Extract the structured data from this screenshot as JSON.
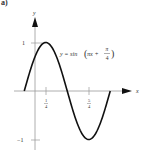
{
  "figure": {
    "panel_label": "a)",
    "equation": {
      "prefix": "y = sin",
      "inner": "πx + ",
      "frac_num": "π",
      "frac_den": "4"
    },
    "axes": {
      "x_label": "x",
      "y_label": "y",
      "y_tick_top": "1",
      "y_tick_bottom": "−1",
      "x_tick_1": {
        "num": "1",
        "den": "4"
      },
      "x_tick_2": {
        "num": "5",
        "den": "4"
      }
    }
  },
  "chart_data": {
    "type": "line",
    "xlabel": "x",
    "ylabel": "y",
    "function": "sin(pi*x + pi/4)",
    "x_range": [
      -0.25,
      1.75
    ],
    "ylim": [
      -1,
      1
    ],
    "x_ticks": [
      "1/4",
      "5/4"
    ],
    "y_ticks": [
      "1",
      "-1"
    ],
    "x": [
      -0.25,
      0,
      0.25,
      0.5,
      0.75,
      1,
      1.25,
      1.5,
      1.75
    ],
    "values": [
      0,
      0.707,
      1,
      0.707,
      0,
      -0.707,
      -1,
      -0.707,
      0
    ],
    "grid": false,
    "legend": null,
    "annotations": [
      "y = sin(πx + π/4) label near maximum"
    ]
  },
  "colors": {
    "curve": "#111111",
    "axes": "#9a9a9a",
    "text": "#333333"
  }
}
